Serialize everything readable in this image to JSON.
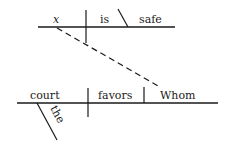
{
  "diagram": {
    "type": "Reed-Kellogg sentence diagram",
    "main_clause": {
      "subject": "court",
      "subject_modifier": "the",
      "verb": "favors",
      "object": "Whom"
    },
    "relative_clause": {
      "subject": "x",
      "verb": "is",
      "predicate_adjective": "safe"
    },
    "connector": "dashed line linking x to Whom"
  }
}
